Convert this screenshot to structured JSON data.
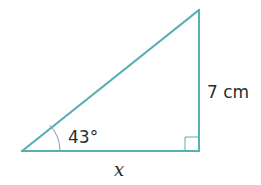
{
  "figure": {
    "type": "right-triangle",
    "colors": {
      "line": "#5aafb3",
      "arc": "#8a9ea0",
      "text": "#2b2b2b"
    },
    "vertices": {
      "A": [
        22,
        151
      ],
      "B": [
        199,
        151
      ],
      "C": [
        199,
        10
      ]
    },
    "right_angle_at": "B",
    "labels": {
      "angle": "43°",
      "vertical_side": "7 cm",
      "horizontal_side": "x"
    }
  }
}
